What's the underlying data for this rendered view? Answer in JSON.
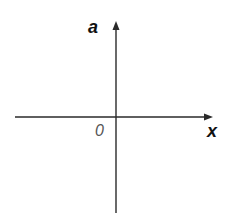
{
  "diagram": {
    "type": "coordinate-axes",
    "y_axis_label": "a",
    "x_axis_label": "x",
    "origin_label": "0",
    "colors": {
      "axis": "#2a2a2a",
      "axis_label": "#111111",
      "origin_label": "#555555",
      "background": "#ffffff"
    }
  }
}
